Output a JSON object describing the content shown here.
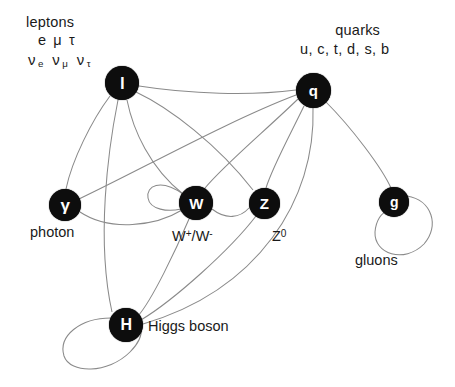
{
  "diagram": {
    "background_color": "#ffffff",
    "node_color": "#0d0d0d",
    "node_text_color": "#ffffff",
    "edge_color": "#8a8a8a",
    "label_color": "#1a1a1a"
  },
  "families": {
    "leptons": {
      "title": "leptons",
      "row1": "e μ τ",
      "nu_e": "ν",
      "nu_e_sub": "e",
      "nu_mu": "ν",
      "nu_mu_sub": "μ",
      "nu_tau": "ν",
      "nu_tau_sub": "τ"
    },
    "quarks": {
      "title": "quarks",
      "row1": "u, c, t, d, s, b"
    }
  },
  "nodes": [
    {
      "id": "lepton",
      "glyph": "l",
      "x": 122,
      "y": 83,
      "r": 17,
      "font_size": 17
    },
    {
      "id": "quark",
      "glyph": "q",
      "x": 313,
      "y": 90,
      "r": 17.5,
      "font_size": 15
    },
    {
      "id": "photon",
      "glyph": "γ",
      "x": 65,
      "y": 205,
      "r": 16,
      "font_size": 17
    },
    {
      "id": "wboson",
      "glyph": "W",
      "x": 196,
      "y": 203,
      "r": 17,
      "font_size": 15
    },
    {
      "id": "zboson",
      "glyph": "Z",
      "x": 264,
      "y": 203,
      "r": 15.5,
      "font_size": 15
    },
    {
      "id": "gluon",
      "glyph": "g",
      "x": 394,
      "y": 202,
      "r": 15,
      "font_size": 14
    },
    {
      "id": "higgs",
      "glyph": "H",
      "x": 126,
      "y": 325,
      "r": 17,
      "font_size": 16
    }
  ],
  "node_labels": {
    "photon": "photon",
    "wboson_pre": "W",
    "wboson_sup1": "+",
    "wboson_mid": "/W",
    "wboson_sup2": "-",
    "zboson_pre": "Z",
    "zboson_sup": "0",
    "gluon": "gluons",
    "higgs": "Higgs boson"
  },
  "edges": [
    {
      "from": "lepton",
      "to": "photon",
      "kind": "curve"
    },
    {
      "from": "lepton",
      "to": "wboson",
      "kind": "curve"
    },
    {
      "from": "lepton",
      "to": "zboson",
      "kind": "curve"
    },
    {
      "from": "lepton",
      "to": "quark",
      "kind": "curve"
    },
    {
      "from": "lepton",
      "to": "higgs",
      "kind": "curve"
    },
    {
      "from": "quark",
      "to": "photon",
      "kind": "curve"
    },
    {
      "from": "quark",
      "to": "wboson",
      "kind": "curve"
    },
    {
      "from": "quark",
      "to": "zboson",
      "kind": "curve"
    },
    {
      "from": "quark",
      "to": "gluon",
      "kind": "curve"
    },
    {
      "from": "quark",
      "to": "higgs",
      "kind": "curve"
    },
    {
      "from": "photon",
      "to": "wboson",
      "kind": "curve"
    },
    {
      "from": "wboson",
      "to": "zboson",
      "kind": "curve"
    },
    {
      "from": "wboson",
      "to": "higgs",
      "kind": "curve"
    },
    {
      "from": "zboson",
      "to": "higgs",
      "kind": "curve"
    },
    {
      "from": "wboson",
      "to": "wboson",
      "kind": "self-loop"
    },
    {
      "from": "gluon",
      "to": "gluon",
      "kind": "self-loop"
    },
    {
      "from": "higgs",
      "to": "higgs",
      "kind": "self-loop"
    }
  ]
}
